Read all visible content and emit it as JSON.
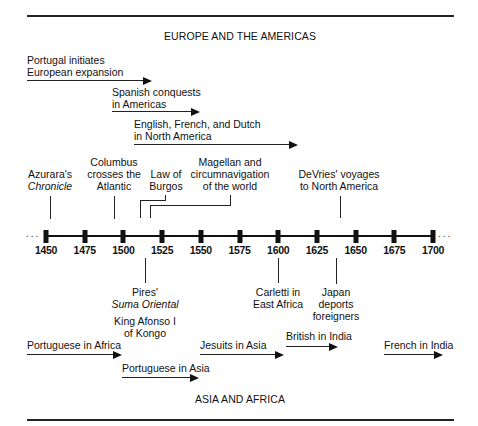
{
  "titles": {
    "top": "EUROPE AND THE AMERICAS",
    "bottom": "ASIA AND AFRICA"
  },
  "axis": {
    "start_dots": "...",
    "end_dots": "...",
    "years": [
      "1450",
      "1475",
      "1500",
      "1525",
      "1550",
      "1575",
      "1600",
      "1625",
      "1650",
      "1675",
      "1700"
    ]
  },
  "europe_arrows": [
    {
      "line1": "Portugal initiates",
      "line2": "European expansion",
      "start_year": 1415,
      "end_year": 1520
    },
    {
      "line1": "Spanish conquests",
      "line2": "in Americas",
      "start_year": 1492,
      "end_year": 1550
    },
    {
      "line1": "English, French, and Dutch",
      "line2": "in North America",
      "start_year": 1507,
      "end_year": 1614
    }
  ],
  "europe_events": [
    {
      "line1": "Azurara's",
      "line2": "Chronicle",
      "year": 1453
    },
    {
      "line1": "Columbus",
      "line2": "crosses the",
      "line3": "Atlantic",
      "year": 1492
    },
    {
      "line1": "Law of",
      "line2": "Burgos",
      "year": 1512
    },
    {
      "line1": "Magellan and",
      "line2": "circumnavigation",
      "line3": "of the world",
      "year": 1519
    },
    {
      "line1": "DeVries' voyages",
      "line2": "to North America",
      "year": 1640
    }
  ],
  "asia_events": [
    {
      "line1": "Pires'",
      "line2": "Suma Oriental",
      "line3": "King Afonso I",
      "line4": "of Kongo",
      "year": 1515
    },
    {
      "line1": "Carletti in",
      "line2": "East Africa",
      "year": 1601
    },
    {
      "line1": "Japan",
      "line2": "deports",
      "line3": "foreigners",
      "year": 1639
    }
  ],
  "asia_arrows": [
    {
      "label": "Portuguese in Africa",
      "start_year": 1415,
      "end_year": 1500
    },
    {
      "label": "Portuguese in Asia",
      "start_year": 1500,
      "end_year": 1550
    },
    {
      "label": "Jesuits in Asia",
      "start_year": 1550,
      "end_year": 1605
    },
    {
      "label": "British in India",
      "start_year": 1606,
      "end_year": 1640
    },
    {
      "label": "French in India",
      "start_year": 1670,
      "end_year": 1707
    }
  ]
}
